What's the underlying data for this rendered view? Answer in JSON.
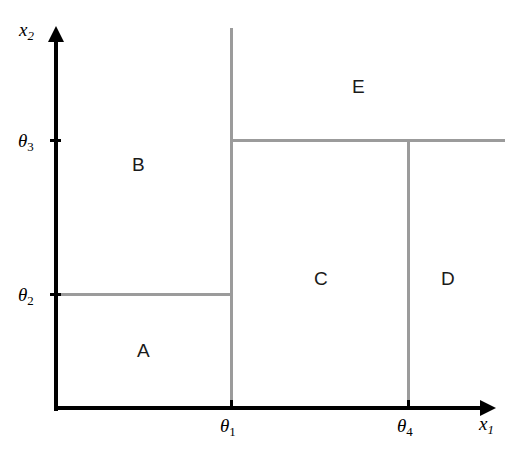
{
  "figure": {
    "type": "diagram",
    "width": 514,
    "height": 463,
    "background_color": "#ffffff",
    "axis_color": "#000000",
    "partition_line_color": "#9b9b9b"
  },
  "axes": {
    "x": {
      "name": "x1",
      "symbol": "x",
      "subscript": "1",
      "origin_px": 57,
      "end_px": 492,
      "baseline_px": 408
    },
    "y": {
      "name": "x2",
      "symbol": "x",
      "subscript": "2",
      "origin_px": 408,
      "end_px": 28,
      "baseline_px": 57
    }
  },
  "ticks": {
    "x_axis": [
      {
        "id": "theta1",
        "symbol": "θ",
        "subscript": "1",
        "x_px": 231
      },
      {
        "id": "theta4",
        "symbol": "θ",
        "subscript": "4",
        "x_px": 408
      }
    ],
    "y_axis": [
      {
        "id": "theta2",
        "symbol": "θ",
        "subscript": "2",
        "y_px": 294
      },
      {
        "id": "theta3",
        "symbol": "θ",
        "subscript": "3",
        "y_px": 140
      }
    ]
  },
  "split_lines": [
    {
      "id": "split-theta1",
      "orientation": "vertical",
      "at_px": 231,
      "from_px": 28,
      "to_px": 408,
      "threshold": "theta1"
    },
    {
      "id": "split-theta2",
      "orientation": "horizontal",
      "at_px": 294,
      "from_px": 57,
      "to_px": 231,
      "threshold": "theta2"
    },
    {
      "id": "split-theta3",
      "orientation": "horizontal",
      "at_px": 140,
      "from_px": 231,
      "to_px": 505,
      "threshold": "theta3"
    },
    {
      "id": "split-theta4",
      "orientation": "vertical",
      "at_px": 408,
      "from_px": 140,
      "to_px": 408,
      "threshold": "theta4"
    }
  ],
  "regions": [
    {
      "id": "A",
      "label": "A",
      "x_px": 143,
      "y_px": 350,
      "bounds": "x1 < theta1, x2 < theta2"
    },
    {
      "id": "B",
      "label": "B",
      "x_px": 138,
      "y_px": 164,
      "bounds": "x1 < theta1, x2 >= theta2"
    },
    {
      "id": "C",
      "label": "C",
      "x_px": 320,
      "y_px": 278,
      "bounds": "theta1 <= x1 < theta4, x2 < theta3"
    },
    {
      "id": "D",
      "label": "D",
      "x_px": 447,
      "y_px": 278,
      "bounds": "x1 >= theta4, x2 < theta3"
    },
    {
      "id": "E",
      "label": "E",
      "x_px": 358,
      "y_px": 86,
      "bounds": "x1 >= theta1, x2 >= theta3"
    }
  ],
  "labels": {
    "x_axis_symbol": "x",
    "x_axis_sub": "1",
    "y_axis_symbol": "x",
    "y_axis_sub": "2",
    "theta_symbol": "θ",
    "theta1_sub": "1",
    "theta2_sub": "2",
    "theta3_sub": "3",
    "theta4_sub": "4",
    "region_a": "A",
    "region_b": "B",
    "region_c": "C",
    "region_d": "D",
    "region_e": "E"
  }
}
